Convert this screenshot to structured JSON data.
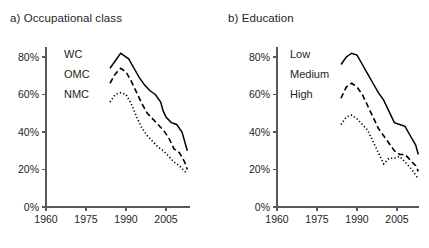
{
  "figure": {
    "panels": [
      {
        "id": "a",
        "title": "a) Occupational class"
      },
      {
        "id": "b",
        "title": "b) Education"
      }
    ]
  },
  "chart_data": [
    {
      "type": "line",
      "panel": "a",
      "title": "a) Occupational class",
      "xlabel": "",
      "ylabel": "",
      "xlim": [
        1960,
        2014
      ],
      "ylim": [
        0,
        90
      ],
      "xticks": [
        1960,
        1975,
        1990,
        2005
      ],
      "xtick_labels": [
        "1960",
        "1975",
        "1990",
        "2005"
      ],
      "yticks": [
        0,
        20,
        40,
        60,
        80
      ],
      "ytick_labels": [
        "0%",
        "20%",
        "40%",
        "60%",
        "80%"
      ],
      "grid": false,
      "legend_position": "inline-left",
      "series": [
        {
          "name": "WC",
          "label": "WC",
          "style": "solid",
          "color": "#000000",
          "x": [
            1984,
            1986,
            1988,
            1989,
            1991,
            1993,
            1995,
            1997,
            1999,
            2001,
            2003,
            2004,
            2005,
            2007,
            2009,
            2011,
            2013
          ],
          "values": [
            74,
            78,
            82,
            81,
            79,
            74,
            69,
            65,
            62,
            60,
            56,
            51,
            48,
            45,
            44,
            40,
            30
          ]
        },
        {
          "name": "OMC",
          "label": "OMC",
          "style": "dashed",
          "color": "#000000",
          "x": [
            1984,
            1986,
            1988,
            1990,
            1992,
            1994,
            1996,
            1998,
            2000,
            2002,
            2004,
            2006,
            2008,
            2010,
            2012,
            2013
          ],
          "values": [
            66,
            71,
            74,
            72,
            67,
            61,
            55,
            50,
            47,
            44,
            41,
            37,
            31,
            29,
            24,
            20
          ]
        },
        {
          "name": "NMC",
          "label": "NMC",
          "style": "dotted",
          "color": "#000000",
          "x": [
            1984,
            1986,
            1988,
            1990,
            1992,
            1994,
            1996,
            1998,
            2000,
            2002,
            2004,
            2006,
            2008,
            2010,
            2012,
            2013
          ],
          "values": [
            56,
            60,
            61,
            60,
            55,
            48,
            42,
            38,
            35,
            32,
            30,
            27,
            24,
            22,
            19,
            18
          ]
        }
      ]
    },
    {
      "type": "line",
      "panel": "b",
      "title": "b) Education",
      "xlabel": "",
      "ylabel": "",
      "xlim": [
        1960,
        2014
      ],
      "ylim": [
        0,
        90
      ],
      "xticks": [
        1960,
        1975,
        1990,
        2005
      ],
      "xtick_labels": [
        "1960",
        "1975",
        "1990",
        "2005"
      ],
      "yticks": [
        0,
        20,
        40,
        60,
        80
      ],
      "ytick_labels": [
        "0%",
        "20%",
        "40%",
        "60%",
        "80%"
      ],
      "grid": false,
      "legend_position": "inline-left",
      "series": [
        {
          "name": "Low",
          "label": "Low",
          "style": "solid",
          "color": "#000000",
          "x": [
            1984,
            1986,
            1988,
            1990,
            1992,
            1994,
            1996,
            1998,
            2000,
            2002,
            2004,
            2006,
            2008,
            2010,
            2012,
            2013
          ],
          "values": [
            76,
            80,
            82,
            81,
            76,
            71,
            66,
            61,
            57,
            51,
            45,
            44,
            43,
            38,
            33,
            28
          ]
        },
        {
          "name": "Medium",
          "label": "Medium",
          "style": "dashed",
          "color": "#000000",
          "x": [
            1984,
            1986,
            1988,
            1990,
            1992,
            1994,
            1996,
            1998,
            2000,
            2002,
            2004,
            2006,
            2008,
            2010,
            2012,
            2013
          ],
          "values": [
            58,
            64,
            66,
            64,
            60,
            54,
            48,
            42,
            38,
            34,
            30,
            28,
            28,
            25,
            22,
            19
          ]
        },
        {
          "name": "High",
          "label": "High",
          "style": "dotted",
          "color": "#000000",
          "x": [
            1984,
            1986,
            1988,
            1990,
            1992,
            1994,
            1996,
            1998,
            2000,
            2002,
            2004,
            2006,
            2008,
            2010,
            2012,
            2013
          ],
          "values": [
            44,
            48,
            49,
            47,
            44,
            41,
            35,
            29,
            23,
            26,
            26,
            27,
            24,
            21,
            17,
            15
          ]
        }
      ]
    }
  ]
}
